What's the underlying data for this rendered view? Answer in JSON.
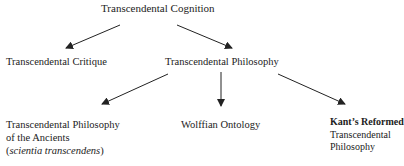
{
  "diagram": {
    "root": {
      "label": "Transcendental Cognition"
    },
    "level2": [
      {
        "label": "Transcendental Critique"
      },
      {
        "label": "Transcendental Philosophy"
      }
    ],
    "level3": [
      {
        "line1": "Transcendental Philosophy",
        "line2": "of the Ancients",
        "line3_open": "(",
        "line3_italic": "scientia transcendens",
        "line3_close": ")"
      },
      {
        "label": "Wolffian Ontology"
      },
      {
        "line1": "Kant’s Reformed",
        "line2": "Transcendental",
        "line3": "Philosophy"
      }
    ],
    "edges": [
      {
        "from": "Transcendental Cognition",
        "to": "Transcendental Critique"
      },
      {
        "from": "Transcendental Cognition",
        "to": "Transcendental Philosophy"
      },
      {
        "from": "Transcendental Philosophy",
        "to": "Transcendental Philosophy of the Ancients (scientia transcendens)"
      },
      {
        "from": "Transcendental Philosophy",
        "to": "Wolffian Ontology"
      },
      {
        "from": "Transcendental Philosophy",
        "to": "Kant’s Reformed Transcendental Philosophy"
      }
    ],
    "colors": {
      "text": "#222222",
      "arrow": "#222222",
      "background": "#ffffff"
    }
  }
}
